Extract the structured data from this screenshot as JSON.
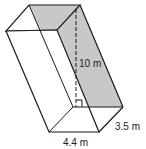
{
  "figure": {
    "type": "oblique prism (parallelepiped)",
    "labels": {
      "height": "10 m",
      "depth": "3.5 m",
      "width": "4.4 m"
    },
    "colors": {
      "stroke": "#1a1a1a",
      "shade": "#c8c8c8",
      "background": "#ffffff"
    }
  }
}
